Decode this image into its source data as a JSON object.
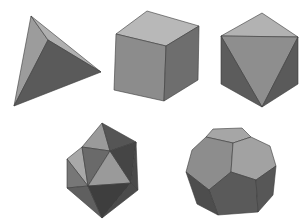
{
  "scene": {
    "description": "Five Platonic solids rendered in grayscale",
    "background": "#ffffff",
    "solids": [
      {
        "name": "tetrahedron",
        "faces": 4
      },
      {
        "name": "cube",
        "faces": 6
      },
      {
        "name": "octahedron",
        "faces": 8
      },
      {
        "name": "icosahedron",
        "faces": 20
      },
      {
        "name": "dodecahedron",
        "faces": 12
      }
    ],
    "shades": {
      "light": "#b4b4b4",
      "mid": "#8f8f8f",
      "midDark": "#727272",
      "dark": "#555555",
      "darker": "#444444",
      "edge": "#3a3a3a"
    }
  }
}
